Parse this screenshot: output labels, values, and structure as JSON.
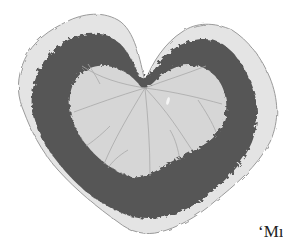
{
  "figure": {
    "caption_fragment": "‘Mı",
    "colors": {
      "background": "#ffffff",
      "leaf_margin": "#e4e4e4",
      "leaf_outline": "#9a9a9a",
      "zone_band": "#555555",
      "leaf_center": "#d6d6d6",
      "veins": "#a8a8a8"
    }
  }
}
